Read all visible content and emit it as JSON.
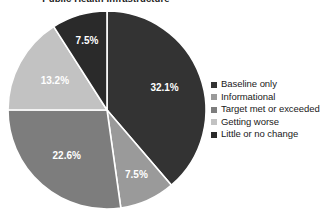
{
  "chart_data": {
    "type": "pie",
    "title": "Public Health Infrastructure",
    "xlabel": "",
    "ylabel": "",
    "legend_position": "right",
    "grid": false,
    "start_angle_deg": 0,
    "direction": "clockwise",
    "categories": [
      "Baseline only",
      "Informational",
      "Target met or exceeded",
      "Getting worse",
      "Little or no change"
    ],
    "values": [
      32.1,
      7.5,
      22.6,
      13.2,
      7.5
    ],
    "value_labels": [
      "32.1%",
      "7.5%",
      "22.6%",
      "13.2%",
      "7.5%"
    ],
    "colors": [
      "#333333",
      "#9a9a9a",
      "#7d7d7d",
      "#c2c2c2",
      "#2a2a2a"
    ],
    "slices": [
      {
        "label": "Baseline only",
        "value": 32.1,
        "display": "32.1%",
        "color": "#333333"
      },
      {
        "label": "Informational",
        "value": 7.5,
        "display": "7.5%",
        "color": "#9a9a9a"
      },
      {
        "label": "Target met or exceeded",
        "value": 22.6,
        "display": "22.6%",
        "color": "#7d7d7d"
      },
      {
        "label": "Getting worse",
        "value": 13.2,
        "display": "13.2%",
        "color": "#c2c2c2"
      },
      {
        "label": "Little or no change",
        "value": 7.5,
        "display": "7.5%",
        "color": "#2a2a2a"
      }
    ],
    "separator_color": "#ffffff",
    "label_text_color": "#ffffff"
  },
  "legend": {
    "items": [
      {
        "label": "Baseline only",
        "color": "#333333"
      },
      {
        "label": "Informational",
        "color": "#9a9a9a"
      },
      {
        "label": "Target met or exceeded",
        "color": "#7d7d7d"
      },
      {
        "label": "Getting worse",
        "color": "#c2c2c2"
      },
      {
        "label": "Little or no change",
        "color": "#2a2a2a"
      }
    ]
  }
}
